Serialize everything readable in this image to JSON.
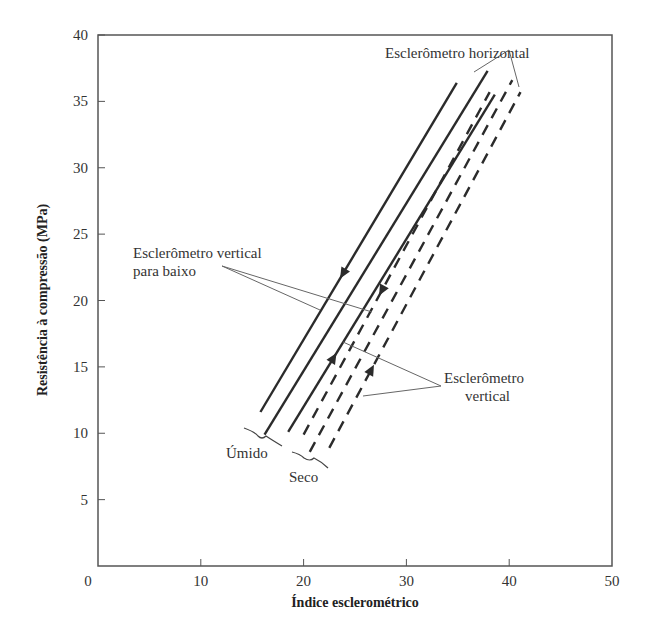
{
  "chart_data": {
    "type": "line",
    "title": "",
    "xlabel": "Índice esclerométrico",
    "ylabel": "Resistência à compressão (MPa)",
    "xlim": [
      0,
      50
    ],
    "ylim": [
      0,
      40
    ],
    "xticks": [
      0,
      10,
      20,
      30,
      40,
      50
    ],
    "yticks": [
      5,
      10,
      15,
      20,
      25,
      30,
      35,
      40
    ],
    "grid": false,
    "series": [
      {
        "name": "Úmido - esclerômetro vertical para baixo",
        "style": "solid",
        "arrow": "down",
        "x": [
          15.8,
          34.9
        ],
        "y": [
          11.6,
          36.4
        ]
      },
      {
        "name": "Úmido - esclerômetro horizontal",
        "style": "solid",
        "arrow": "none",
        "x": [
          16.2,
          37.9
        ],
        "y": [
          9.9,
          37.3
        ]
      },
      {
        "name": "Úmido - esclerômetro vertical",
        "style": "solid",
        "arrow": "up",
        "x": [
          18.5,
          38.6
        ],
        "y": [
          10.1,
          35.5
        ]
      },
      {
        "name": "Seco - esclerômetro vertical para baixo",
        "style": "dashed",
        "arrow": "down",
        "x": [
          20.0,
          38.1
        ],
        "y": [
          9.9,
          35.7
        ]
      },
      {
        "name": "Seco - esclerômetro horizontal",
        "style": "dashed",
        "arrow": "none",
        "x": [
          20.6,
          40.3
        ],
        "y": [
          8.6,
          36.6
        ]
      },
      {
        "name": "Seco - esclerômetro vertical",
        "style": "dashed",
        "arrow": "up",
        "x": [
          22.5,
          41.1
        ],
        "y": [
          8.9,
          35.7
        ]
      }
    ],
    "annotations": [
      {
        "text": "Esclerômetro horizontal",
        "position": "top-right"
      },
      {
        "text": "Esclerômetro vertical para baixo",
        "position": "left-middle"
      },
      {
        "text": "Esclerômetro vertical",
        "position": "right-lower"
      },
      {
        "text": "Úmido",
        "position": "bottom-left brace"
      },
      {
        "text": "Seco",
        "position": "bottom brace"
      }
    ]
  },
  "labels": {
    "x_axis_title": "Índice esclerométrico",
    "y_axis_title": "Resistência à compressão (MPa)",
    "annot_horizontal": "Esclerômetro horizontal",
    "annot_vertical_down_line1": "Esclerômetro vertical",
    "annot_vertical_down_line2": "para baixo",
    "annot_vertical_line1": "Esclerômetro",
    "annot_vertical_line2": "vertical",
    "annot_wet": "Úmido",
    "annot_dry": "Seco"
  },
  "colors": {
    "line": "#2b2b2b",
    "axis": "#444444",
    "leader": "#666666"
  }
}
